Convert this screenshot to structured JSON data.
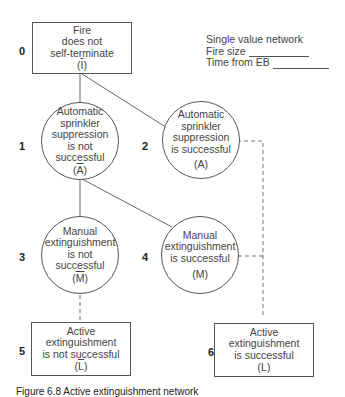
{
  "legend": {
    "title": "Single value network",
    "fire_size_label": "Fire size",
    "time_label": "Time from EB"
  },
  "nodes": [
    {
      "id": 0,
      "number": "0",
      "shape": "box",
      "lines": [
        "Fire",
        "does not",
        "self-terminate"
      ],
      "symbol": "I",
      "negated": true
    },
    {
      "id": 1,
      "number": "1",
      "shape": "circle",
      "lines": [
        "Automatic",
        "sprinkler",
        "suppression",
        "is not",
        "successful"
      ],
      "symbol": "A",
      "negated": true
    },
    {
      "id": 2,
      "number": "2",
      "shape": "circle",
      "lines": [
        "Automatic",
        "sprinkler",
        "suppression",
        "is successful"
      ],
      "symbol": "A",
      "negated": false
    },
    {
      "id": 3,
      "number": "3",
      "shape": "circle",
      "lines": [
        "Manual",
        "extinguishment",
        "is not",
        "successful"
      ],
      "symbol": "M",
      "negated": true
    },
    {
      "id": 4,
      "number": "4",
      "shape": "circle",
      "lines": [
        "Manual",
        "extinguishment",
        "is successful"
      ],
      "symbol": "M",
      "negated": false
    },
    {
      "id": 5,
      "number": "5",
      "shape": "box",
      "lines": [
        "Active",
        "extinguishment",
        "is not successful"
      ],
      "symbol": "L",
      "negated": true
    },
    {
      "id": 6,
      "number": "6",
      "shape": "box",
      "lines": [
        "Active",
        "extinguishment",
        "is successful"
      ],
      "symbol": "L",
      "negated": false
    }
  ],
  "node_text": {
    "n0": {
      "l1": "Fire",
      "l2": "does not",
      "l3": "self-terminate",
      "sym": "I"
    },
    "n1": {
      "l1": "Automatic",
      "l2": "sprinkler",
      "l3": "suppression",
      "l4": "is not",
      "l5": "successful",
      "sym": "A"
    },
    "n2": {
      "l1": "Automatic",
      "l2": "sprinkler",
      "l3": "suppression",
      "l4": "is successful",
      "sym": "A"
    },
    "n3": {
      "l1": "Manual",
      "l2": "extinguishment",
      "l3": "is not",
      "l4": "successful",
      "sym": "M"
    },
    "n4": {
      "l1": "Manual",
      "l2": "extinguishment",
      "l3": "is successful",
      "sym": "M"
    },
    "n5": {
      "l1": "Active",
      "l2": "extinguishment",
      "l3": "is not successful",
      "sym": "L"
    },
    "n6": {
      "l1": "Active",
      "l2": "extinguishment",
      "l3": "is successful",
      "sym": "L"
    }
  },
  "numbers": {
    "n0": "0",
    "n1": "1",
    "n2": "2",
    "n3": "3",
    "n4": "4",
    "n5": "5",
    "n6": "6"
  },
  "edges": [
    {
      "from": 0,
      "to": 1,
      "style": "solid"
    },
    {
      "from": 0,
      "to": 2,
      "style": "solid"
    },
    {
      "from": 1,
      "to": 3,
      "style": "solid"
    },
    {
      "from": 1,
      "to": 4,
      "style": "solid"
    },
    {
      "from": 3,
      "to": 5,
      "style": "dashed"
    },
    {
      "from": 2,
      "to": 6,
      "style": "dashed"
    },
    {
      "from": 4,
      "to": 6,
      "style": "dashed"
    }
  ],
  "caption": "Figure 6.8  Active extinguishment network"
}
